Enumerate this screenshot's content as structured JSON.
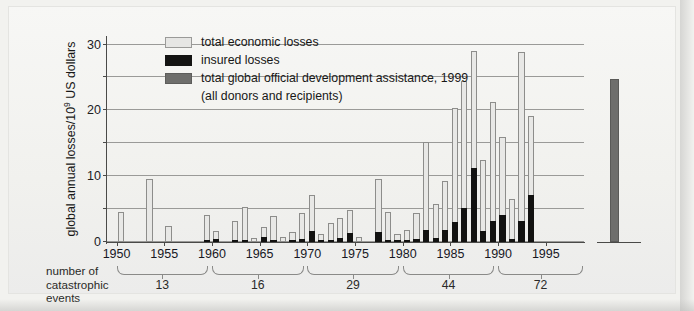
{
  "chart_data": {
    "type": "bar",
    "title": "",
    "xlabel": "",
    "ylabel": "global annual losses/10⁹ US dollars",
    "ylabel_prefix": "global annual losses/10",
    "ylabel_exponent": "9",
    "ylabel_suffix": " US dollars",
    "ylim": [
      0,
      62
    ],
    "yticks": [
      0,
      10,
      20,
      30,
      40,
      50,
      60
    ],
    "ytick_labels": [
      "0",
      "10",
      "20",
      "30",
      "40",
      "50",
      "60"
    ],
    "xlim": [
      1949,
      1999
    ],
    "xticks": [
      1950,
      1955,
      1960,
      1965,
      1970,
      1975,
      1980,
      1985,
      1990,
      1995
    ],
    "xtick_labels": [
      "1950",
      "1955",
      "1960",
      "1965",
      "1970",
      "1975",
      "1980",
      "1985",
      "1990",
      "1995"
    ],
    "grid": true,
    "grid_axis": "y",
    "legend_position": "upper-left-inside",
    "series": [
      {
        "name": "total economic losses",
        "color": "#e8e8e6",
        "years": [
          1950,
          1951,
          1952,
          1953,
          1954,
          1955,
          1956,
          1957,
          1958,
          1959,
          1960,
          1961,
          1962,
          1963,
          1964,
          1965,
          1966,
          1967,
          1968,
          1969,
          1970,
          1971,
          1972,
          1973,
          1974,
          1975,
          1976,
          1977,
          1978,
          1979,
          1980,
          1981,
          1982,
          1983,
          1984,
          1985,
          1986,
          1987,
          1988,
          1989,
          1990,
          1991,
          1992,
          1993,
          1994,
          1995,
          1996,
          1997,
          1998
        ],
        "values": [
          9.0,
          0,
          0,
          19.3,
          0,
          4.8,
          0,
          0,
          0,
          8.2,
          3.2,
          0,
          6.3,
          10.6,
          1.3,
          4.6,
          8.0,
          1.6,
          3.1,
          8.8,
          14.4,
          2.4,
          5.8,
          7.2,
          9.7,
          1.6,
          0,
          19.0,
          9.2,
          2.3,
          3.8,
          8.7,
          30.4,
          11.5,
          18.5,
          40.6,
          49.0,
          58.2,
          25.0,
          42.6,
          32.0,
          13.0,
          57.9,
          38.4,
          0,
          0,
          0,
          0,
          0
        ]
      },
      {
        "name": "insured losses",
        "color": "#121211",
        "years": [
          1950,
          1951,
          1952,
          1953,
          1954,
          1955,
          1956,
          1957,
          1958,
          1959,
          1960,
          1961,
          1962,
          1963,
          1964,
          1965,
          1966,
          1967,
          1968,
          1969,
          1970,
          1971,
          1972,
          1973,
          1974,
          1975,
          1976,
          1977,
          1978,
          1979,
          1980,
          1981,
          1982,
          1983,
          1984,
          1985,
          1986,
          1987,
          1988,
          1989,
          1990,
          1991,
          1992,
          1993,
          1994,
          1995,
          1996,
          1997,
          1998
        ],
        "values": [
          0,
          0,
          0,
          0,
          0,
          0,
          0,
          0,
          0,
          0.7,
          0.9,
          0,
          0.6,
          0.3,
          0,
          1.4,
          0.4,
          0,
          0.7,
          1.0,
          3.2,
          0.6,
          0.4,
          1.1,
          2.7,
          0,
          0,
          2.9,
          0.6,
          0.3,
          0.3,
          1.0,
          3.8,
          1.2,
          3.6,
          6.2,
          10.2,
          22.5,
          3.4,
          6.4,
          8.1,
          1.0,
          6.3,
          14.2,
          0,
          0,
          0,
          0,
          0
        ]
      },
      {
        "name": "total global official development assistance, 1999 (all donors and recipients)",
        "color": "#6e6e6c",
        "values": [
          49.5
        ],
        "standalone": true
      }
    ],
    "catastrophic_event_groups": [
      {
        "period": "1950-1959",
        "count": "13"
      },
      {
        "period": "1960-1969",
        "count": "16"
      },
      {
        "period": "1970-1979",
        "count": "29"
      },
      {
        "period": "1980-1989",
        "count": "44"
      },
      {
        "period": "1990-1999",
        "count": "72"
      }
    ]
  },
  "axis": {
    "y_label_prefix": "global annual losses/10",
    "y_label_exponent": "9",
    "y_label_suffix": " US dollars",
    "y_ticks": [
      "60",
      "50",
      "40",
      "30",
      "20",
      "10",
      "0"
    ],
    "x_ticks": [
      "1950",
      "1955",
      "1960",
      "1965",
      "1970",
      "1975",
      "1980",
      "1985",
      "1990",
      "1995"
    ]
  },
  "legend": {
    "items": [
      {
        "label": "total economic losses",
        "swatch": "light-grey",
        "color": "#e6e6e4"
      },
      {
        "label": "insured losses",
        "swatch": "black",
        "color": "#141413"
      },
      {
        "label": "total global official development assistance, 1999",
        "swatch": "dark-grey",
        "color": "#6e6e6c"
      }
    ],
    "sub_line": "(all donors and recipients)"
  },
  "footer": {
    "caption_line1": "number of",
    "caption_line2": "catastrophic events",
    "counts": [
      "13",
      "16",
      "29",
      "44",
      "72"
    ]
  }
}
